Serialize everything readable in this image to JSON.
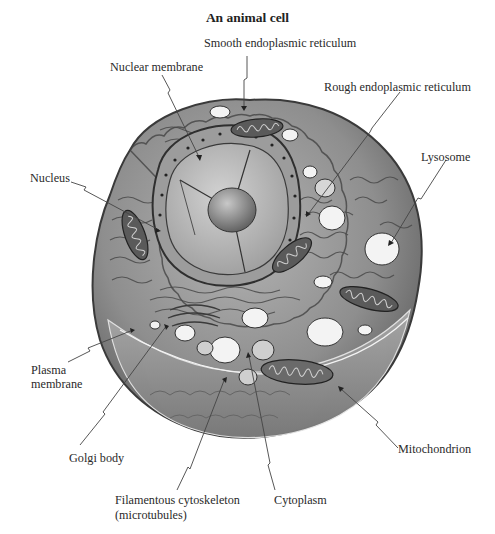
{
  "diagram": {
    "title": "An animal cell",
    "labels": {
      "smooth_er": "Smooth endoplasmic reticulum",
      "nuclear_membrane": "Nuclear membrane",
      "rough_er": "Rough endoplasmic reticulum",
      "lysosome": "Lysosome",
      "nucleus": "Nucleus",
      "plasma_membrane_line1": "Plasma",
      "plasma_membrane_line2": "membrane",
      "golgi_body": "Golgi body",
      "mitochondrion": "Mitochondrion",
      "filamentous_line1": "Filamentous cytoskeleton",
      "filamentous_line2": "(microtubules)",
      "cytoplasm": "Cytoplasm"
    },
    "colors": {
      "background": "#ffffff",
      "cell_outer": "#8a8a8a",
      "cell_inner": "#a9a9a9",
      "nucleus": "#b8b8b8",
      "nucleolus": "#8c8c8c",
      "vesicle": "#f2f2f2",
      "mitochondria": "#555555",
      "leader_line": "#444444"
    }
  }
}
